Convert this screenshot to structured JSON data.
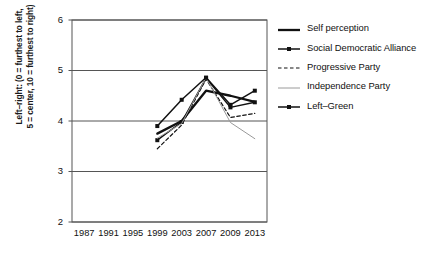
{
  "chart_data": {
    "type": "line",
    "title": "",
    "xlabel": "",
    "ylabel": "Left–right: (0 = furthest to left,\n5 = center, 10 = furthest to right)",
    "categories": [
      "1987",
      "1991",
      "1995",
      "1999",
      "2003",
      "2007",
      "2009",
      "2013"
    ],
    "ylim": [
      2,
      6
    ],
    "yticks": [
      "2",
      "3",
      "4",
      "5",
      "6"
    ],
    "grid": true,
    "legend_position": "right",
    "series": [
      {
        "name": "Self perception",
        "style": "solid-thick",
        "color": "#111111",
        "markers": false,
        "values": [
          null,
          null,
          null,
          3.75,
          4.0,
          4.6,
          4.5,
          4.38
        ]
      },
      {
        "name": "Social Democratic Alliance",
        "style": "solid-marker",
        "color": "#111111",
        "markers": true,
        "values": [
          null,
          null,
          null,
          3.62,
          3.98,
          4.85,
          4.27,
          4.37
        ]
      },
      {
        "name": "Progressive Party",
        "style": "dashed",
        "color": "#111111",
        "markers": false,
        "values": [
          null,
          null,
          null,
          3.45,
          3.92,
          4.83,
          4.07,
          4.15
        ]
      },
      {
        "name": "Independence Party",
        "style": "solid-thin",
        "color": "#9a9a9a",
        "markers": false,
        "values": [
          null,
          null,
          null,
          3.66,
          3.95,
          4.86,
          3.97,
          3.65
        ]
      },
      {
        "name": "Left–Green",
        "style": "solid-marker",
        "color": "#111111",
        "markers": true,
        "values": [
          null,
          null,
          null,
          3.9,
          4.42,
          4.86,
          4.32,
          4.6
        ]
      }
    ]
  }
}
